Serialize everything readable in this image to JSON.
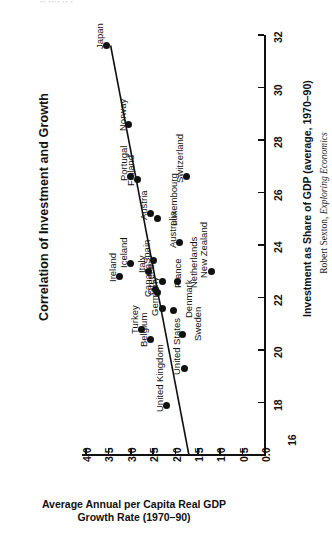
{
  "top_artifact": "••  ••••  ••  •",
  "title": "Correlation of Investment and Growth",
  "credit": {
    "author": "Robert Sexton,",
    "work": "Exploring Economics"
  },
  "chart_data": {
    "type": "scatter",
    "title": "Correlation of Investment and Growth",
    "orientation": "rotated-90ccw",
    "xlabel": "Average Annual per Capita Real GDP Growth Rate (1970–90)",
    "ylabel": "Investment as Share of GDP (average, 1970–90)",
    "xlim": [
      0.0,
      4.0
    ],
    "ylim": [
      16,
      32
    ],
    "x_ticks": [
      "4.0",
      "3.5",
      "3.0",
      "2.5",
      "2.0",
      "1.5",
      "1.0",
      "0.5",
      "0.0"
    ],
    "x_tick_values": [
      4.0,
      3.5,
      3.0,
      2.5,
      2.0,
      1.5,
      1.0,
      0.5,
      0.0
    ],
    "y_ticks": [
      "16",
      "18",
      "20",
      "22",
      "24",
      "26",
      "28",
      "30",
      "32"
    ],
    "y_tick_values": [
      16,
      18,
      20,
      22,
      24,
      26,
      28,
      30,
      32
    ],
    "x_axis_reversed": true,
    "grid": false,
    "legend": false,
    "trendline": {
      "label": "fitted negative trend",
      "x_start": 3.45,
      "y_start": 31.6,
      "x_end": 1.7,
      "y_end": 16.0
    },
    "points": [
      {
        "label": "Japan",
        "x": 3.55,
        "y": 31.6
      },
      {
        "label": "Norway",
        "x": 3.05,
        "y": 28.6
      },
      {
        "label": "Portugal",
        "x": 3.0,
        "y": 26.6
      },
      {
        "label": "Finland",
        "x": 2.85,
        "y": 26.5
      },
      {
        "label": "Austria",
        "x": 2.55,
        "y": 25.2
      },
      {
        "label": "Luxembourg",
        "x": 2.4,
        "y": 25.0
      },
      {
        "label": "Iceland",
        "x": 3.0,
        "y": 23.3
      },
      {
        "label": "Spain",
        "x": 2.5,
        "y": 23.4
      },
      {
        "label": "Italy",
        "x": 2.6,
        "y": 23.0
      },
      {
        "label": "Ireland",
        "x": 3.25,
        "y": 22.8
      },
      {
        "label": "Australia",
        "x": 1.9,
        "y": 24.1
      },
      {
        "label": "Switzerland",
        "x": 1.75,
        "y": 26.6
      },
      {
        "label": "New Zealand",
        "x": 1.2,
        "y": 23.0
      },
      {
        "label": "Canada",
        "x": 2.45,
        "y": 22.3
      },
      {
        "label": "Greece",
        "x": 2.4,
        "y": 22.2
      },
      {
        "label": "France",
        "x": 2.3,
        "y": 22.6
      },
      {
        "label": "Netherlands",
        "x": 1.95,
        "y": 22.6
      },
      {
        "label": "Germany",
        "x": 2.3,
        "y": 21.6
      },
      {
        "label": "Denmark",
        "x": 2.05,
        "y": 21.5
      },
      {
        "label": "Turkey",
        "x": 2.75,
        "y": 20.8
      },
      {
        "label": "Sweden",
        "x": 1.85,
        "y": 20.6
      },
      {
        "label": "Belgium",
        "x": 2.55,
        "y": 20.4
      },
      {
        "label": "United States",
        "x": 1.8,
        "y": 19.3
      },
      {
        "label": "United Kingdom",
        "x": 2.2,
        "y": 17.9
      }
    ]
  }
}
